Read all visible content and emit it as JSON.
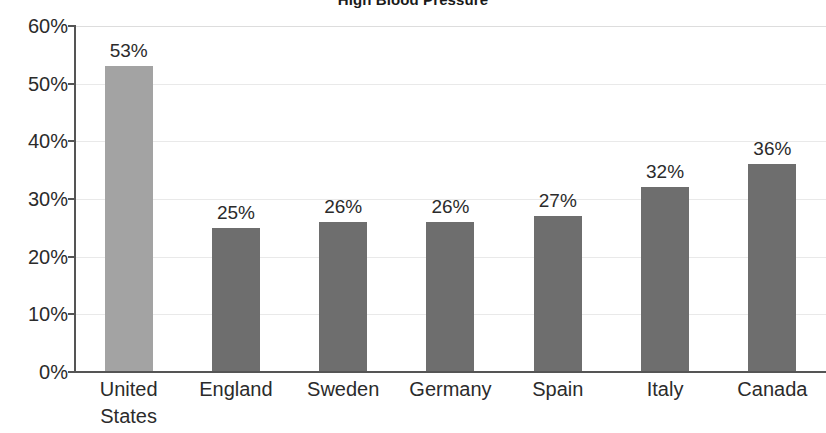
{
  "chart_data": {
    "type": "bar",
    "title": "High Blood Pressure",
    "xlabel": "",
    "ylabel": "",
    "ylim": [
      0,
      60
    ],
    "ytick_labels": [
      "0%",
      "10%",
      "20%",
      "30%",
      "40%",
      "50%",
      "60%"
    ],
    "ytick_values": [
      0,
      10,
      20,
      30,
      40,
      50,
      60
    ],
    "grid": true,
    "legend": "none",
    "categories": [
      "United States",
      "England",
      "Sweden",
      "Germany",
      "Spain",
      "Italy",
      "Canada"
    ],
    "category_lines": [
      [
        "United",
        "States"
      ],
      [
        "England"
      ],
      [
        "Sweden"
      ],
      [
        "Germany"
      ],
      [
        "Spain"
      ],
      [
        "Italy"
      ],
      [
        "Canada"
      ]
    ],
    "values": [
      53,
      25,
      26,
      26,
      27,
      32,
      36
    ],
    "value_labels": [
      "53%",
      "25%",
      "26%",
      "26%",
      "27%",
      "32%",
      "36%"
    ],
    "highlight_index": 0,
    "colors": {
      "bar": "#6e6e6e",
      "bar_highlight": "#a3a3a3",
      "axis": "#555555",
      "gridline": "#e9e9e9",
      "text": "#2b2b2b",
      "title": "#1a1a1a",
      "background": "#ffffff"
    }
  }
}
